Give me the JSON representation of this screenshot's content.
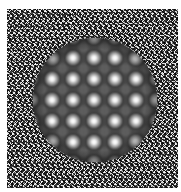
{
  "image": {
    "description": "Visual stimulus: square of binary random noise with a centered circular patch containing a grid of bright Gaussian blobs (plaid pattern) on dark background",
    "noise_square": {
      "x": 7,
      "y": 9,
      "width": 171,
      "height": 179
    },
    "circle_patch": {
      "center_x": 95,
      "center_y": 100,
      "radius": 62
    },
    "spot_grid": {
      "spacing_px": 21,
      "columns_x": [
        52,
        73,
        94,
        115,
        136
      ],
      "rows_y": [
        58,
        79,
        100,
        121,
        142
      ]
    },
    "colors": {
      "background": "#ffffff",
      "noise_dark": "#000000",
      "noise_light": "#ffffff",
      "patch_dark": "#1a1a1a",
      "spot_peak": "#ffffff"
    }
  }
}
